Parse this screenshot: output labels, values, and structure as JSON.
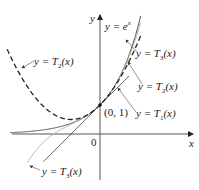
{
  "figure": {
    "axes": {
      "x_label": "x",
      "y_label": "y",
      "origin_label": "0"
    },
    "point_label": "(0, 1)",
    "curves": [
      {
        "id": "exp",
        "label": "y = e^x",
        "label_text": "y = e",
        "label_sup": "x",
        "style": "solid",
        "color": "#333333"
      },
      {
        "id": "T1",
        "label": "y = T1(x)",
        "label_main": "y = T",
        "label_sub": "1",
        "label_tail": "(x)",
        "style": "solid",
        "color": "#222222"
      },
      {
        "id": "T2",
        "label": "y = T2(x)",
        "label_main": "y = T",
        "label_sub": "2",
        "label_tail": "(x)",
        "style": "dashed",
        "color": "#222222"
      },
      {
        "id": "T3",
        "label": "y = T3(x)",
        "label_main": "y = T",
        "label_sub": "3",
        "label_tail": "(x)",
        "style": "solid-light",
        "color": "#999999"
      }
    ]
  },
  "chart_data": {
    "type": "line",
    "title": "",
    "xlabel": "x",
    "ylabel": "y",
    "series": [
      {
        "name": "y = e^x",
        "function": "e^x"
      },
      {
        "name": "y = T1(x)",
        "function": "1 + x"
      },
      {
        "name": "y = T2(x)",
        "function": "1 + x + x^2/2"
      },
      {
        "name": "y = T3(x)",
        "function": "1 + x + x^2/2 + x^3/6"
      }
    ],
    "annotations": [
      "(0, 1)",
      "0"
    ],
    "grid": false
  }
}
